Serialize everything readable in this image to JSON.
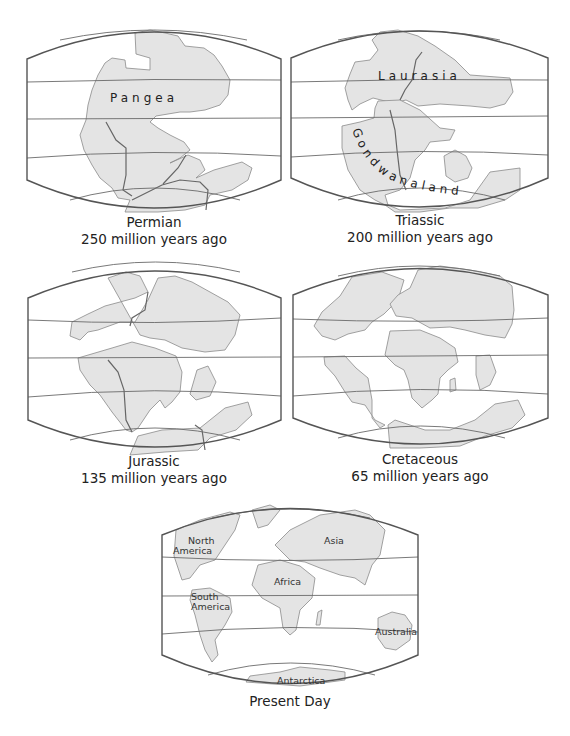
{
  "figure": {
    "maps": [
      {
        "id": "permian",
        "era": "Permian",
        "age": "250 million years ago",
        "supercontinent_label": "Pangea"
      },
      {
        "id": "triassic",
        "era": "Triassic",
        "age": "200 million years ago",
        "landmass_labels": [
          "Laurasia",
          "Gondwanaland"
        ]
      },
      {
        "id": "jurassic",
        "era": "Jurassic",
        "age": "135 million years ago"
      },
      {
        "id": "cretaceous",
        "era": "Cretaceous",
        "age": "65 million years ago"
      },
      {
        "id": "present",
        "era": "Present Day",
        "continent_labels": {
          "north_america_1": "North",
          "north_america_2": "America",
          "south_america_1": "South",
          "south_america_2": "America",
          "africa": "Africa",
          "asia": "Asia",
          "australia": "Australia",
          "antarctica": "Antarctica"
        }
      }
    ],
    "colors": {
      "land": "#e4e4e4",
      "outline": "#8a8a8a",
      "frame": "#555555",
      "background": "#ffffff"
    }
  }
}
